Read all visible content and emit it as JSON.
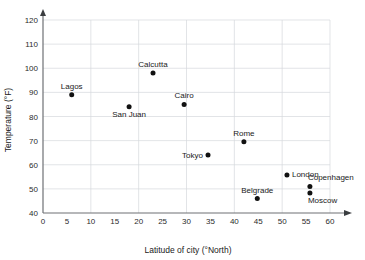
{
  "chart_data": {
    "type": "scatter",
    "title": "",
    "xlabel": "Latitude of city (°North)",
    "ylabel": "Temperature (°F)",
    "xlim": [
      0,
      60
    ],
    "ylim": [
      40,
      120
    ],
    "xticks": [
      0,
      5,
      10,
      15,
      20,
      25,
      30,
      35,
      40,
      45,
      50,
      55,
      60
    ],
    "yticks": [
      40,
      50,
      60,
      70,
      80,
      90,
      100,
      110,
      120
    ],
    "xtick_labels": [
      "0",
      "5",
      "10",
      "15",
      "20",
      "25",
      "30",
      "35",
      "40",
      "45",
      "50",
      "55",
      "60"
    ],
    "ytick_labels": [
      "40",
      "50",
      "60",
      "70",
      "80",
      "90",
      "100",
      "110",
      "120"
    ],
    "grid": true,
    "grid_x_step": 10,
    "grid_y_step": 10,
    "legend": "none",
    "x_axis_arrow": true,
    "y_axis_arrow": true,
    "marker_color": "#111111",
    "grid_color": "#d6d9dd",
    "axis_color": "#6e7175",
    "points": [
      {
        "label": "Lagos",
        "x": 6,
        "y": 89,
        "label_pos": "above"
      },
      {
        "label": "San Juan",
        "x": 18,
        "y": 84,
        "label_pos": "below"
      },
      {
        "label": "Calcutta",
        "x": 23,
        "y": 98,
        "label_pos": "above"
      },
      {
        "label": "Cairo",
        "x": 29.5,
        "y": 85,
        "label_pos": "above"
      },
      {
        "label": "Tokyo",
        "x": 34.5,
        "y": 64,
        "label_pos": "left"
      },
      {
        "label": "Rome",
        "x": 42,
        "y": 69.5,
        "label_pos": "above"
      },
      {
        "label": "Belgrade",
        "x": 44.8,
        "y": 46,
        "label_pos": "above"
      },
      {
        "label": "London",
        "x": 51,
        "y": 55.8,
        "label_pos": "right"
      },
      {
        "label": "Copenhagen",
        "x": 55.8,
        "y": 51,
        "label_pos": "above-right"
      },
      {
        "label": "Moscow",
        "x": 55.8,
        "y": 48.3,
        "label_pos": "below-right"
      }
    ]
  }
}
